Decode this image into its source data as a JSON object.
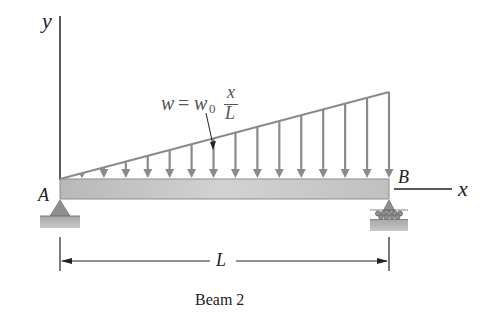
{
  "figure": {
    "caption": "Beam 2",
    "axes": {
      "y_label": "y",
      "x_label": "x"
    },
    "points": {
      "left_support": "A",
      "right_support": "B"
    },
    "load": {
      "lhs": "w",
      "equals": "=",
      "coef": "w",
      "coef_sub": "0",
      "frac_num": "x",
      "frac_den": "L",
      "type": "linearly varying distributed load",
      "arrow_count": 15
    },
    "dimension": {
      "label": "L"
    },
    "supports": {
      "A": "pin",
      "B": "roller"
    },
    "colors": {
      "load_arrows": "#8a8a8a",
      "beam_fill": "#c8c8c8",
      "beam_edge": "#8c8c8c",
      "support_fill": "#9a9a9a",
      "ground_fill": "#b5b5b5",
      "line": "#222222",
      "label": "#222222"
    }
  }
}
